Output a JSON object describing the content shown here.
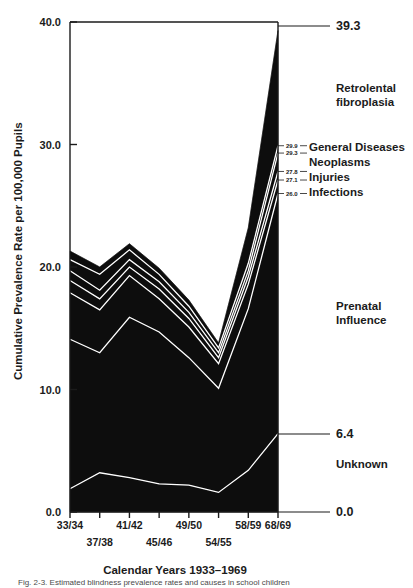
{
  "figure": {
    "caption": "Fig. 2-3.   Estimated blindness prevalence rates and causes in school children",
    "ylabel": "Cumulative Prevalence Rate per 100,000 Pupils",
    "xlabel": "Calendar Years 1933–1969"
  },
  "axis": {
    "y_ticks": [
      "40.0",
      "30.0",
      "20.0",
      "10.0",
      "0.0"
    ],
    "y_tick_values": [
      40.0,
      30.0,
      20.0,
      10.0,
      0.0
    ],
    "x_ticks_top": [
      "33/34",
      "41/42",
      "49/50",
      "58/59",
      "68/69"
    ],
    "x_ticks_bottom": [
      "37/38",
      "45/46",
      "54/55"
    ]
  },
  "end_labels": {
    "total": "39.3",
    "unknown_top": "6.4",
    "baseline": "0.0"
  },
  "band_callouts": [
    {
      "value": "29.9",
      "label": "General Diseases"
    },
    {
      "value": "29.3",
      "label": "Neoplasms"
    },
    {
      "value": "27.8",
      "label": "Injuries"
    },
    {
      "value": "27.1",
      "label": "Infections"
    },
    {
      "value": "26.0",
      "label": ""
    }
  ],
  "band_names": {
    "retrolental": "Retrolental",
    "fibroplasia": "fibroplasia",
    "prenatal": "Prenatal",
    "influence": "Influence",
    "unknown": "Unknown"
  },
  "colors": {
    "ink": "#0d0d0d",
    "paper": "#ffffff"
  },
  "chart_data": {
    "type": "area",
    "title": "",
    "xlabel": "Calendar Years 1933–1969",
    "ylabel": "Cumulative Prevalence Rate per 100,000 Pupils",
    "ylim": [
      0.0,
      40.0
    ],
    "grid": false,
    "legend_position": "right-inline",
    "stacked": true,
    "note": "Cumulative (stacked) boundary curves, bottom-to-top. Values are cumulative rate per 100,000 pupils.",
    "categories": [
      "33/34",
      "37/38",
      "41/42",
      "45/46",
      "49/50",
      "54/55",
      "58/59",
      "68/69"
    ],
    "x": [
      1933,
      1937,
      1941,
      1945,
      1949,
      1954,
      1958,
      1968
    ],
    "series": [
      {
        "name": "Unknown",
        "cumulative": [
          1.9,
          3.2,
          2.8,
          2.3,
          2.2,
          1.6,
          3.4,
          6.4
        ]
      },
      {
        "name": "Prenatal Influence",
        "cumulative": [
          14.1,
          13.0,
          15.9,
          14.7,
          12.6,
          10.1,
          16.6,
          26.0
        ]
      },
      {
        "name": "Infections",
        "cumulative": [
          17.9,
          16.5,
          19.3,
          17.4,
          15.1,
          12.1,
          18.6,
          27.1
        ]
      },
      {
        "name": "Injuries",
        "cumulative": [
          18.9,
          17.4,
          20.0,
          18.2,
          15.8,
          12.6,
          19.2,
          27.8
        ]
      },
      {
        "name": "Neoplasms",
        "cumulative": [
          19.7,
          18.1,
          20.6,
          18.8,
          16.3,
          13.0,
          19.7,
          29.3
        ]
      },
      {
        "name": "General Diseases",
        "cumulative": [
          20.6,
          19.4,
          21.4,
          19.4,
          16.8,
          13.4,
          20.3,
          29.9
        ]
      },
      {
        "name": "Retrolental fibroplasia",
        "cumulative": [
          21.3,
          20.0,
          21.9,
          19.9,
          17.3,
          13.8,
          23.2,
          39.3
        ]
      }
    ],
    "endpoint_values": {
      "Unknown": 6.4,
      "Prenatal Influence": 26.0,
      "Infections": 27.1,
      "Injuries": 27.8,
      "Neoplasms": 29.3,
      "General Diseases": 29.9,
      "Retrolental fibroplasia": 39.3
    }
  }
}
